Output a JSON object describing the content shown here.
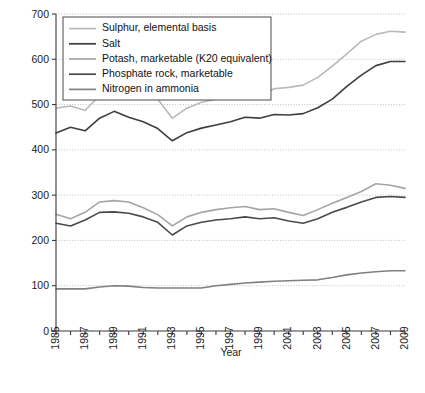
{
  "chart_data": {
    "type": "line",
    "title": "",
    "xlabel": "Year",
    "ylabel": "",
    "xlim": [
      1985,
      2009
    ],
    "ylim": [
      0,
      700
    ],
    "ytick_step": 100,
    "yticks": [
      0,
      100,
      200,
      300,
      400,
      500,
      600,
      700
    ],
    "xticks": [
      1985,
      1986,
      1987,
      1988,
      1989,
      1990,
      1991,
      1992,
      1993,
      1994,
      1995,
      1996,
      1997,
      1998,
      1999,
      2000,
      2001,
      2002,
      2003,
      2004,
      2005,
      2006,
      2007,
      2008,
      2009
    ],
    "xtick_labels": [
      "1985",
      "",
      "1987",
      "",
      "1989",
      "",
      "1991",
      "",
      "1993",
      "",
      "1995",
      "",
      "1997",
      "",
      "1999",
      "",
      "2001",
      "",
      "2003",
      "",
      "2005",
      "",
      "2007",
      "",
      "2009"
    ],
    "grid": true,
    "grid_axis": "y",
    "legend_position": "top-left",
    "x": [
      1985,
      1986,
      1987,
      1988,
      1989,
      1990,
      1991,
      1992,
      1993,
      1994,
      1995,
      1996,
      1997,
      1998,
      1999,
      2000,
      2001,
      2002,
      2003,
      2004,
      2005,
      2006,
      2007,
      2008,
      2009
    ],
    "series": [
      {
        "name": "Sulphur, elemental basis",
        "color": "#b9b9b9",
        "values": [
          492,
          497,
          487,
          520,
          545,
          540,
          527,
          512,
          470,
          492,
          505,
          512,
          520,
          530,
          518,
          535,
          538,
          543,
          560,
          585,
          612,
          640,
          655,
          662,
          660
        ]
      },
      {
        "name": "Salt",
        "color": "#3e3e3e",
        "values": [
          437,
          450,
          442,
          470,
          485,
          472,
          462,
          447,
          420,
          438,
          448,
          455,
          462,
          472,
          470,
          478,
          477,
          480,
          493,
          512,
          540,
          565,
          586,
          595,
          595
        ]
      },
      {
        "name": "Potash, marketable (K20 equivalent)",
        "color": "#a5a5a5",
        "values": [
          258,
          248,
          262,
          285,
          288,
          285,
          272,
          257,
          232,
          252,
          262,
          268,
          272,
          275,
          268,
          270,
          262,
          255,
          268,
          282,
          295,
          308,
          325,
          322,
          315
        ]
      },
      {
        "name": "Phosphate rock, marketable",
        "color": "#4a4a4a",
        "values": [
          238,
          232,
          245,
          262,
          263,
          260,
          252,
          240,
          212,
          232,
          240,
          245,
          248,
          252,
          248,
          250,
          243,
          238,
          248,
          262,
          273,
          285,
          295,
          297,
          295
        ]
      },
      {
        "name": "Nitrogen in ammonia",
        "color": "#808080",
        "values": [
          93,
          93,
          93,
          97,
          100,
          99,
          96,
          95,
          95,
          95,
          95,
          100,
          103,
          106,
          108,
          110,
          111,
          112,
          113,
          118,
          124,
          128,
          131,
          133,
          133
        ]
      }
    ]
  }
}
